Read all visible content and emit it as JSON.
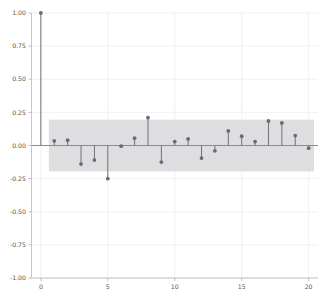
{
  "chart_data": {
    "type": "bar",
    "subtype": "stem-acf",
    "title": "",
    "subtitle": "",
    "xlabel": "",
    "ylabel": "",
    "grid": true,
    "legend": "none",
    "xlim": [
      -0.7,
      20.7
    ],
    "ylim": [
      -1.0,
      1.0
    ],
    "x": [
      0,
      1,
      2,
      3,
      4,
      5,
      6,
      7,
      8,
      9,
      10,
      11,
      12,
      13,
      14,
      15,
      16,
      17,
      18,
      19,
      20
    ],
    "categories": [
      "0",
      "1",
      "2",
      "3",
      "4",
      "5",
      "6",
      "7",
      "8",
      "9",
      "10",
      "11",
      "12",
      "13",
      "14",
      "15",
      "16",
      "17",
      "18",
      "19",
      "20"
    ],
    "values": [
      1.0,
      0.035,
      0.04,
      -0.14,
      -0.11,
      -0.25,
      -0.005,
      0.055,
      0.21,
      -0.125,
      0.03,
      0.05,
      -0.095,
      -0.04,
      0.11,
      0.07,
      0.03,
      0.185,
      0.17,
      0.075,
      -0.02
    ],
    "series": [
      {
        "name": "autocorrelation",
        "values": [
          1.0,
          0.035,
          0.04,
          -0.14,
          -0.11,
          -0.25,
          -0.005,
          0.055,
          0.21,
          -0.125,
          0.03,
          0.05,
          -0.095,
          -0.04,
          0.11,
          0.07,
          0.03,
          0.185,
          0.17,
          0.075,
          -0.02
        ]
      }
    ],
    "confidence_band": {
      "upper": 0.195,
      "lower": -0.195,
      "x_start": 0.6,
      "x_end": 20.4,
      "color": "#d8d8dc"
    },
    "xticks": [
      0,
      5,
      10,
      15,
      20
    ],
    "xtick_labels": [
      "0",
      "5",
      "10",
      "15",
      "20"
    ],
    "yticks": [
      -1.0,
      -0.75,
      -0.5,
      -0.25,
      0.0,
      0.25,
      0.5,
      0.75,
      1.0
    ],
    "ytick_labels": [
      "-1.00",
      "-0.75",
      "-0.50",
      "-0.25",
      "0.00",
      "0.25",
      "0.50",
      "0.75",
      "1.00"
    ],
    "colors": {
      "stem": "#70707a",
      "marker": "#6a6a74",
      "grid": "#e9e9ef",
      "band": "#d8d8dc",
      "axis": "#b9b9c2",
      "zero": "#8a8a92",
      "background": "#ffffff",
      "tick_text": "#555555"
    }
  }
}
